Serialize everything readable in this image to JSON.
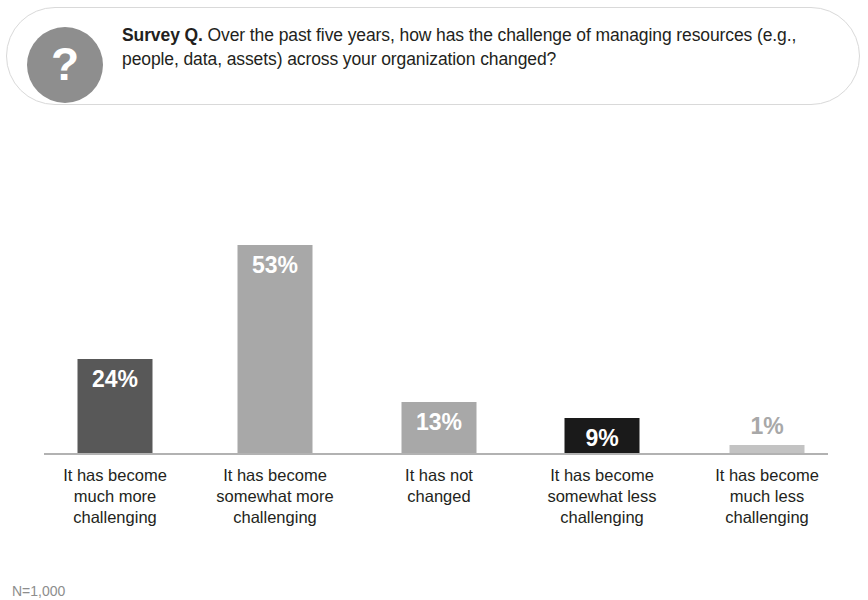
{
  "callout": {
    "badge_icon": "question-mark-icon",
    "badge_glyph": "?",
    "lead_label": "Survey Q.",
    "question": " Over the past five years, how has the challenge of managing resources (e.g., people, data, assets) across your organization changed?"
  },
  "footnote": "N=1,000",
  "colors": {
    "bar_dark_gray": "#585858",
    "bar_light_gray": "#a8a8a8",
    "bar_black": "#1a1a1a",
    "bar_pale_gray": "#c3c3c3",
    "badge_gray": "#8e8e8e",
    "baseline_gray": "#b2b2b2",
    "text": "#231f20"
  },
  "chart_data": {
    "type": "bar",
    "title": "Over the past five years, how has the challenge of managing resources (e.g., people, data, assets) across your organization changed?",
    "xlabel": "",
    "ylabel": "",
    "ylim": [
      0,
      60
    ],
    "grid": false,
    "legend": "none",
    "categories": [
      "It has become much more challenging",
      "It has become somewhat more challenging",
      "It has not changed",
      "It has become somewhat less challenging",
      "It has become much less challenging"
    ],
    "category_lines": [
      [
        "It has become",
        "much more",
        "challenging"
      ],
      [
        "It has become",
        "somewhat more",
        "challenging"
      ],
      [
        "It has not",
        "changed"
      ],
      [
        "It has become",
        "somewhat less",
        "challenging"
      ],
      [
        "It has become",
        "much less",
        "challenging"
      ]
    ],
    "values": [
      24,
      53,
      13,
      9,
      1
    ],
    "value_labels": [
      "24%",
      "53%",
      "13%",
      "9%",
      "1%"
    ],
    "bar_colors": [
      "#585858",
      "#a8a8a8",
      "#a8a8a8",
      "#1a1a1a",
      "#c3c3c3"
    ],
    "label_placement": [
      "inside",
      "inside",
      "inside",
      "inside",
      "outside"
    ],
    "note": "N=1,000"
  }
}
